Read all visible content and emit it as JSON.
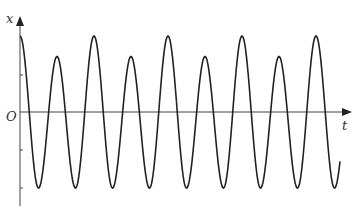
{
  "chart_data": {
    "type": "line",
    "title": "",
    "xlabel": "t",
    "ylabel": "x",
    "origin_label": "O",
    "grid": false,
    "legend": null,
    "y_ticks": [
      "+A/2 approx",
      "-A/2 approx",
      "-A approx"
    ],
    "series": [
      {
        "name": "x(t)",
        "peaks": [
          {
            "t_index": 0,
            "x": 1.0
          },
          {
            "t_index": 1,
            "x": 0.73
          },
          {
            "t_index": 2,
            "x": 1.0
          },
          {
            "t_index": 3,
            "x": 0.73
          },
          {
            "t_index": 4,
            "x": 1.0
          },
          {
            "t_index": 5,
            "x": 0.73
          },
          {
            "t_index": 6,
            "x": 1.0
          },
          {
            "t_index": 7,
            "x": 0.73
          },
          {
            "t_index": 8,
            "x": 1.0
          }
        ],
        "trough_value": -1.0,
        "end_value": -0.37
      }
    ]
  },
  "labels": {
    "x_axis": "t",
    "y_axis": "x",
    "origin": "O"
  }
}
